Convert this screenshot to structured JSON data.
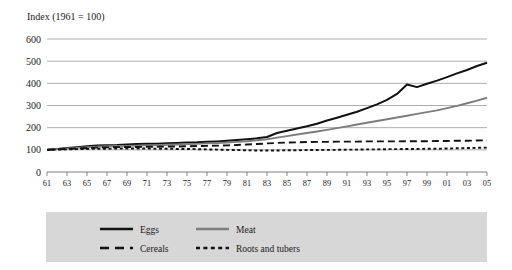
{
  "chart_data": {
    "type": "line",
    "title": "Index (1961 = 100)",
    "xlabel": "",
    "ylabel": "",
    "ylim": [
      0,
      600
    ],
    "yticks": [
      0,
      100,
      200,
      300,
      400,
      500,
      600
    ],
    "grid": true,
    "legend_position": "bottom",
    "origin_label": "0",
    "x": [
      1961,
      1962,
      1963,
      1964,
      1965,
      1966,
      1967,
      1968,
      1969,
      1970,
      1971,
      1972,
      1973,
      1974,
      1975,
      1976,
      1977,
      1978,
      1979,
      1980,
      1981,
      1982,
      1983,
      1984,
      1985,
      1986,
      1987,
      1988,
      1989,
      1990,
      1991,
      1992,
      1993,
      1994,
      1995,
      1996,
      1997,
      1998,
      1999,
      2000,
      2001,
      2002,
      2003,
      2004,
      2005
    ],
    "xtick_labels": [
      "61",
      "63",
      "65",
      "67",
      "69",
      "71",
      "73",
      "75",
      "77",
      "79",
      "81",
      "83",
      "85",
      "87",
      "89",
      "91",
      "93",
      "95",
      "97",
      "99",
      "01",
      "03",
      "05"
    ],
    "xtick_values": [
      1961,
      1963,
      1965,
      1967,
      1969,
      1971,
      1973,
      1975,
      1977,
      1979,
      1981,
      1983,
      1985,
      1987,
      1989,
      1991,
      1993,
      1995,
      1997,
      1999,
      2001,
      2003,
      2005
    ],
    "series": [
      {
        "name": "Eggs",
        "color": "#111111",
        "style": "solid",
        "width": 2.0,
        "values": [
          100,
          104,
          108,
          112,
          116,
          119,
          121,
          122,
          124,
          126,
          127,
          128,
          130,
          131,
          133,
          134,
          136,
          138,
          141,
          144,
          148,
          152,
          158,
          176,
          186,
          196,
          206,
          218,
          232,
          245,
          258,
          272,
          288,
          305,
          325,
          352,
          395,
          383,
          398,
          412,
          428,
          445,
          460,
          478,
          493
        ]
      },
      {
        "name": "Meat",
        "color": "#7d7d7d",
        "style": "solid",
        "width": 1.9,
        "values": [
          100,
          103,
          106,
          109,
          112,
          114,
          116,
          117,
          118,
          119,
          120,
          121,
          123,
          124,
          126,
          127,
          129,
          131,
          133,
          136,
          139,
          143,
          148,
          155,
          162,
          169,
          176,
          183,
          190,
          198,
          206,
          214,
          222,
          230,
          238,
          246,
          254,
          262,
          270,
          278,
          288,
          298,
          310,
          322,
          335
        ]
      },
      {
        "name": "Cereals",
        "color": "#111111",
        "style": "dashed",
        "width": 1.9,
        "values": [
          100,
          102,
          104,
          106,
          108,
          110,
          111,
          112,
          113,
          113,
          114,
          114,
          115,
          115,
          116,
          117,
          118,
          119,
          120,
          122,
          124,
          126,
          129,
          131,
          133,
          134,
          135,
          136,
          136,
          137,
          137,
          137,
          138,
          138,
          138,
          138,
          139,
          139,
          139,
          140,
          140,
          141,
          141,
          142,
          143
        ]
      },
      {
        "name": "Roots and tubers",
        "color": "#111111",
        "style": "dotted",
        "width": 1.9,
        "values": [
          100,
          101,
          102,
          103,
          104,
          105,
          105,
          106,
          106,
          106,
          106,
          105,
          105,
          104,
          104,
          103,
          102,
          101,
          100,
          99,
          98,
          97,
          97,
          97,
          98,
          98,
          99,
          99,
          100,
          100,
          101,
          101,
          102,
          102,
          103,
          103,
          104,
          104,
          105,
          105,
          106,
          107,
          108,
          109,
          110
        ]
      }
    ]
  },
  "legend": {
    "entries": [
      {
        "label": "Eggs"
      },
      {
        "label": "Meat"
      },
      {
        "label": "Cereals"
      },
      {
        "label": "Roots and tubers"
      }
    ]
  }
}
